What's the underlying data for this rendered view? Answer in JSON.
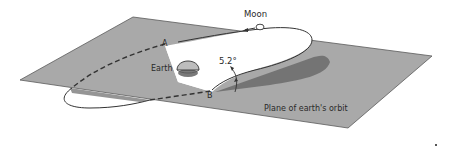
{
  "diagram": {
    "type": "astronomy-orbit-inclination",
    "labels": {
      "moon": "Moon",
      "earth": "Earth",
      "node_a": "A",
      "node_b": "B",
      "angle": "5.2°",
      "plane": "Plane of earth's orbit"
    },
    "colors": {
      "plane_fill": "#a9a9a9",
      "plane_edge": "#4a4a4a",
      "orbit_fill": "#ffffff",
      "orbit_stroke": "#333333",
      "shadow": "#6e6e6e",
      "earth_fill": "#bdbdbd",
      "earth_shadow": "#7a7a7a",
      "text": "#2a2a2a"
    }
  }
}
